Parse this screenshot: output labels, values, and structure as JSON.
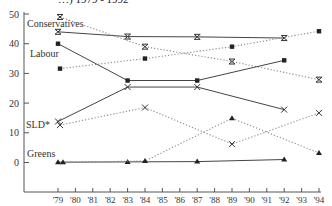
{
  "chart_data": {
    "type": "line",
    "title": "…) 1979 - 1992",
    "xlabel": "",
    "ylabel": "",
    "ylim": [
      -10,
      50
    ],
    "yticks": [
      0,
      10,
      20,
      30,
      40,
      50
    ],
    "xticks": [
      "'79",
      "'80",
      "'81",
      "'82",
      "'83",
      "'84",
      "'85",
      "'86",
      "'87",
      "'88",
      "'89",
      "'90",
      "'91",
      "'92",
      "'93",
      "'94"
    ],
    "grid": false,
    "legend_position": "inline labels at left",
    "line_styles": {
      "solid": "general elections",
      "dotted": "european elections"
    },
    "series": [
      {
        "name": "Conservatives",
        "style": "solid",
        "marker": "x-box",
        "x": [
          1979,
          1983,
          1987,
          1992
        ],
        "values": [
          44.0,
          42.4,
          42.3,
          41.9
        ]
      },
      {
        "name": "Conservatives",
        "style": "dotted",
        "marker": "x-box",
        "x": [
          1979,
          1984,
          1989,
          1994
        ],
        "values": [
          49.0,
          39.0,
          34.0,
          27.9
        ]
      },
      {
        "name": "Labour",
        "style": "solid",
        "marker": "square",
        "x": [
          1979,
          1983,
          1987,
          1992
        ],
        "values": [
          40.0,
          27.6,
          27.6,
          34.4
        ]
      },
      {
        "name": "Labour",
        "style": "dotted",
        "marker": "square",
        "x": [
          1979,
          1984,
          1989,
          1994
        ],
        "values": [
          31.6,
          35.0,
          39.0,
          44.2
        ]
      },
      {
        "name": "SLD*",
        "style": "solid",
        "marker": "x",
        "x": [
          1979,
          1983,
          1987,
          1992
        ],
        "values": [
          13.8,
          25.4,
          25.4,
          17.8
        ]
      },
      {
        "name": "SLD*",
        "style": "dotted",
        "marker": "x",
        "x": [
          1979,
          1984,
          1989,
          1994
        ],
        "values": [
          12.6,
          18.5,
          6.2,
          16.7
        ]
      },
      {
        "name": "Greens",
        "style": "solid",
        "marker": "triangle",
        "x": [
          1979,
          1983,
          1987,
          1992
        ],
        "values": [
          0.1,
          0.2,
          0.3,
          1.0
        ]
      },
      {
        "name": "Greens",
        "style": "dotted",
        "marker": "triangle",
        "x": [
          1979,
          1984,
          1989,
          1994
        ],
        "values": [
          0.1,
          0.5,
          14.9,
          3.2
        ]
      }
    ],
    "labels": [
      {
        "text": "Conservatives",
        "y": 46
      },
      {
        "text": "Labour",
        "y": 36
      },
      {
        "text": "SLD*",
        "y": 12
      },
      {
        "text": "Greens",
        "y": 2
      }
    ]
  }
}
